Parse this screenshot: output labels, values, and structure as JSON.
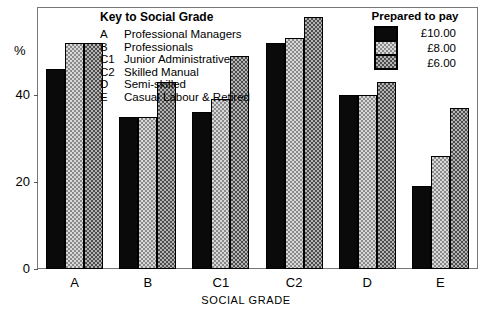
{
  "chart_data": {
    "type": "bar",
    "title": "",
    "xlabel": "SOCIAL GRADE",
    "ylabel": "%",
    "ylim": [
      0,
      60
    ],
    "yticks": [
      0,
      20,
      40
    ],
    "ytick_labels": [
      "0",
      "20",
      "40"
    ],
    "grid": false,
    "legend_position": "top-right",
    "categories": [
      "A",
      "B",
      "C1",
      "C2",
      "D",
      "E"
    ],
    "series": [
      {
        "name": "£10.00",
        "color": "#0a0a0a",
        "values": [
          46,
          35,
          36,
          52,
          40,
          19
        ]
      },
      {
        "name": "£8.00",
        "color": "#d8d8d8",
        "values": [
          52,
          35,
          39,
          53,
          40,
          26
        ]
      },
      {
        "name": "£6.00",
        "color": "#b4b4b4",
        "values": [
          52,
          43,
          49,
          58,
          43,
          37
        ]
      }
    ]
  },
  "key": {
    "title": "Key to Social Grade",
    "rows": [
      {
        "code": "A",
        "desc": "Professional Managers"
      },
      {
        "code": "B",
        "desc": "Professionals"
      },
      {
        "code": "C1",
        "desc": "Junior Administrative"
      },
      {
        "code": "C2",
        "desc": "Skilled Manual"
      },
      {
        "code": "D",
        "desc": "Semi-skilled"
      },
      {
        "code": "E",
        "desc": "Casual Labour & Retired"
      }
    ]
  },
  "legend": {
    "title": "Prepared to pay",
    "entries": [
      {
        "label": "£10.00",
        "swatch": "black"
      },
      {
        "label": "£8.00",
        "swatch": "light"
      },
      {
        "label": "£6.00",
        "swatch": "dark"
      }
    ]
  }
}
